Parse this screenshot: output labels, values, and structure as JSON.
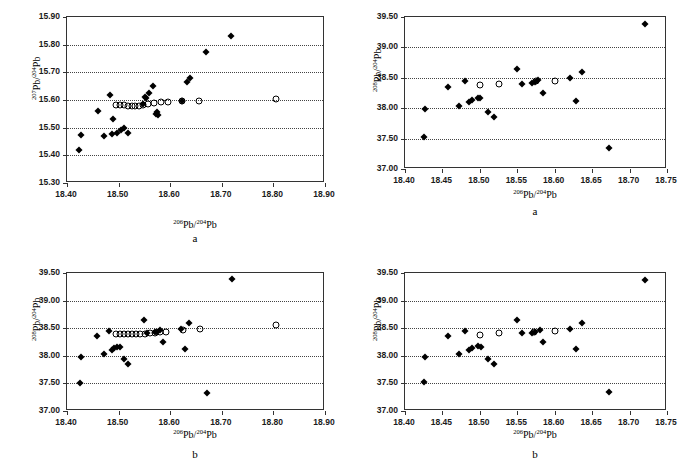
{
  "figure": {
    "panel_count": 4
  },
  "chart_data": [
    {
      "id": "top-left",
      "type": "scatter",
      "title": "",
      "caption": "a",
      "xlabel_html": "<sup>206</sup>Pb/<sup>204</sup>Pb",
      "ylabel_html": "<sup>207</sup>Pb/<sup>204</sup>Pb",
      "xlim": [
        18.4,
        18.9
      ],
      "ylim": [
        15.3,
        15.9
      ],
      "xticks": [
        "18.40",
        "18.50",
        "18.60",
        "18.70",
        "18.80",
        "18.90"
      ],
      "yticks": [
        "15.30",
        "15.40",
        "15.50",
        "15.60",
        "15.70",
        "15.80",
        "15.90"
      ],
      "grid": true,
      "legend": "none",
      "series": [
        {
          "name": "filled-diamond",
          "marker": "diamond",
          "points": [
            [
              18.424,
              15.418
            ],
            [
              18.427,
              15.472
            ],
            [
              18.46,
              15.562
            ],
            [
              18.472,
              15.47
            ],
            [
              18.484,
              15.618
            ],
            [
              18.487,
              15.477
            ],
            [
              18.49,
              15.533
            ],
            [
              18.497,
              15.481
            ],
            [
              18.505,
              15.492
            ],
            [
              18.51,
              15.497
            ],
            [
              18.519,
              15.481
            ],
            [
              18.566,
              15.65
            ],
            [
              18.558,
              15.626
            ],
            [
              18.553,
              15.606
            ],
            [
              18.551,
              15.612
            ],
            [
              18.547,
              15.584
            ],
            [
              18.572,
              15.549
            ],
            [
              18.574,
              15.556
            ],
            [
              18.576,
              15.545
            ],
            [
              18.622,
              15.596
            ],
            [
              18.633,
              15.665
            ],
            [
              18.639,
              15.681
            ],
            [
              18.67,
              15.775
            ],
            [
              18.718,
              15.831
            ]
          ]
        },
        {
          "name": "open-circle",
          "marker": "circle",
          "points": [
            [
              18.495,
              15.582
            ],
            [
              18.503,
              15.582
            ],
            [
              18.51,
              15.581
            ],
            [
              18.518,
              15.58
            ],
            [
              18.525,
              15.578
            ],
            [
              18.532,
              15.578
            ],
            [
              18.54,
              15.58
            ],
            [
              18.548,
              15.582
            ],
            [
              18.557,
              15.586
            ],
            [
              18.568,
              15.589
            ],
            [
              18.582,
              15.591
            ],
            [
              18.595,
              15.593
            ],
            [
              18.623,
              15.595
            ],
            [
              18.656,
              15.595
            ],
            [
              18.806,
              15.603
            ]
          ]
        }
      ]
    },
    {
      "id": "top-right",
      "type": "scatter",
      "title": "",
      "caption": "a",
      "xlabel_html": "<sup>206</sup>Pb/<sup>204</sup>Pb",
      "ylabel_html": "<sup>208</sup>Pb/<sup>204</sup>Pb",
      "xlim": [
        18.4,
        18.75
      ],
      "ylim": [
        37.0,
        39.5
      ],
      "xticks": [
        "18.40",
        "18.45",
        "18.50",
        "18.55",
        "18.60",
        "18.65",
        "18.70",
        "18.75"
      ],
      "yticks": [
        "37.00",
        "37.50",
        "38.00",
        "38.50",
        "39.00",
        "39.50"
      ],
      "grid": true,
      "legend": "none",
      "series": [
        {
          "name": "filled-diamond",
          "marker": "diamond",
          "points": [
            [
              18.426,
              37.525
            ],
            [
              18.427,
              37.985
            ],
            [
              18.458,
              38.355
            ],
            [
              18.472,
              38.03
            ],
            [
              18.48,
              38.445
            ],
            [
              18.486,
              38.105
            ],
            [
              18.49,
              38.135
            ],
            [
              18.497,
              38.165
            ],
            [
              18.5,
              38.16
            ],
            [
              18.511,
              37.935
            ],
            [
              18.519,
              37.85
            ],
            [
              18.549,
              38.64
            ],
            [
              18.556,
              38.405
            ],
            [
              18.569,
              38.42
            ],
            [
              18.573,
              38.43
            ],
            [
              18.578,
              38.47
            ],
            [
              18.585,
              38.25
            ],
            [
              18.62,
              38.49
            ],
            [
              18.628,
              38.125
            ],
            [
              18.637,
              38.6
            ],
            [
              18.672,
              37.34
            ],
            [
              18.72,
              39.38
            ]
          ]
        },
        {
          "name": "open-circle",
          "marker": "circle",
          "points": [
            [
              18.5,
              38.385
            ],
            [
              18.526,
              38.405
            ],
            [
              18.575,
              38.44
            ],
            [
              18.6,
              38.455
            ]
          ]
        }
      ]
    },
    {
      "id": "bottom-left",
      "type": "scatter",
      "title": "",
      "caption": "b",
      "xlabel_html": "<sup>206</sup>Pb/<sup>204</sup>Pb",
      "ylabel_html": "<sup>208</sup>Pb/<sup>204</sup>Pb",
      "xlim": [
        18.4,
        18.9
      ],
      "ylim": [
        37.0,
        39.5
      ],
      "xticks": [
        "18.40",
        "18.50",
        "18.60",
        "18.70",
        "18.80",
        "18.90"
      ],
      "yticks": [
        "37.00",
        "37.50",
        "38.00",
        "38.50",
        "39.00",
        "39.50"
      ],
      "grid": true,
      "legend": "none",
      "series": [
        {
          "name": "filled-diamond",
          "marker": "diamond",
          "points": [
            [
              18.426,
              37.515
            ],
            [
              18.427,
              37.985
            ],
            [
              18.458,
              38.355
            ],
            [
              18.472,
              38.035
            ],
            [
              18.482,
              38.445
            ],
            [
              18.487,
              38.105
            ],
            [
              18.492,
              38.14
            ],
            [
              18.497,
              38.165
            ],
            [
              18.502,
              38.16
            ],
            [
              18.511,
              37.935
            ],
            [
              18.519,
              37.855
            ],
            [
              18.549,
              38.64
            ],
            [
              18.556,
              38.41
            ],
            [
              18.57,
              38.425
            ],
            [
              18.575,
              38.435
            ],
            [
              18.58,
              38.47
            ],
            [
              18.586,
              38.25
            ],
            [
              18.62,
              38.49
            ],
            [
              18.628,
              38.13
            ],
            [
              18.637,
              38.6
            ],
            [
              18.672,
              37.33
            ],
            [
              18.719,
              39.385
            ]
          ]
        },
        {
          "name": "open-circle",
          "marker": "circle",
          "points": [
            [
              18.494,
              38.4
            ],
            [
              18.502,
              38.4
            ],
            [
              18.51,
              38.4
            ],
            [
              18.518,
              38.395
            ],
            [
              18.526,
              38.39
            ],
            [
              18.534,
              38.39
            ],
            [
              18.542,
              38.39
            ],
            [
              18.551,
              38.4
            ],
            [
              18.56,
              38.41
            ],
            [
              18.57,
              38.42
            ],
            [
              18.58,
              38.43
            ],
            [
              18.592,
              38.44
            ],
            [
              18.624,
              38.47
            ],
            [
              18.657,
              38.48
            ],
            [
              18.806,
              38.56
            ]
          ]
        }
      ]
    },
    {
      "id": "bottom-right",
      "type": "scatter",
      "title": "",
      "caption": "b",
      "xlabel_html": "<sup>206</sup>Pb/<sup>204</sup>Pb",
      "ylabel_html": "<sup>208</sup>Pb/<sup>204</sup>Pb",
      "xlim": [
        18.4,
        18.75
      ],
      "ylim": [
        37.0,
        39.5
      ],
      "xticks": [
        "18.40",
        "18.45",
        "18.50",
        "18.55",
        "18.60",
        "18.65",
        "18.70",
        "18.75"
      ],
      "yticks": [
        "37.00",
        "37.50",
        "38.00",
        "38.50",
        "39.00",
        "39.50"
      ],
      "grid": true,
      "legend": "none",
      "series": [
        {
          "name": "filled-diamond",
          "marker": "diamond",
          "points": [
            [
              18.426,
              37.525
            ],
            [
              18.427,
              37.985
            ],
            [
              18.458,
              38.355
            ],
            [
              18.472,
              38.03
            ],
            [
              18.48,
              38.445
            ],
            [
              18.486,
              38.105
            ],
            [
              18.49,
              38.135
            ],
            [
              18.497,
              38.17
            ],
            [
              18.501,
              38.16
            ],
            [
              18.511,
              37.935
            ],
            [
              18.519,
              37.85
            ],
            [
              18.549,
              38.64
            ],
            [
              18.556,
              38.41
            ],
            [
              18.569,
              38.42
            ],
            [
              18.574,
              38.43
            ],
            [
              18.58,
              38.47
            ],
            [
              18.585,
              38.25
            ],
            [
              18.62,
              38.49
            ],
            [
              18.628,
              38.125
            ],
            [
              18.637,
              38.6
            ],
            [
              18.672,
              37.34
            ],
            [
              18.72,
              39.38
            ]
          ]
        },
        {
          "name": "open-circle",
          "marker": "circle",
          "points": [
            [
              18.5,
              38.385
            ],
            [
              18.526,
              38.405
            ],
            [
              18.572,
              38.44
            ],
            [
              18.6,
              38.455
            ]
          ]
        }
      ]
    }
  ]
}
